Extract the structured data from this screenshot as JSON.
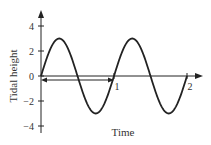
{
  "chart_data": {
    "type": "line",
    "title": "",
    "xlabel": "Time",
    "ylabel": "Tidal height",
    "xlim": [
      0,
      2.1
    ],
    "ylim": [
      -4.5,
      4.5
    ],
    "y_ticks": [
      4,
      2,
      0,
      -2,
      -4
    ],
    "y_tick_labels": [
      "4",
      "2",
      "0",
      "−2",
      "−4"
    ],
    "x_ticks": [
      1,
      2
    ],
    "x_tick_labels": [
      "1",
      "2"
    ],
    "series": [
      {
        "name": "tidal height",
        "function": "3*sin(2*pi*t)",
        "amplitude": 3,
        "period": 1,
        "x": [
          0,
          0.25,
          0.5,
          0.75,
          1,
          1.25,
          1.5,
          1.75,
          2
        ],
        "values": [
          0,
          3,
          0,
          -3,
          0,
          3,
          0,
          -3,
          0
        ]
      }
    ],
    "annotations": [
      {
        "type": "double-arrow",
        "from": 0,
        "to": 1,
        "y": -0.25,
        "meaning": "one period"
      }
    ],
    "grid": false,
    "legend": null
  }
}
